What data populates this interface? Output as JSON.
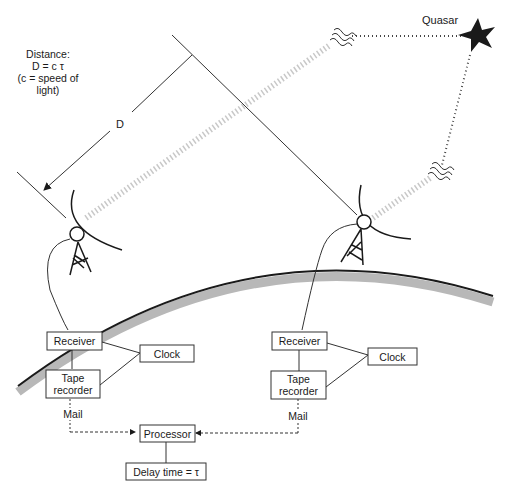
{
  "diagram": {
    "type": "Very Long Baseline Interferometry (VLBI) schematic",
    "source_label": "Quasar",
    "distance_note": {
      "line1": "Distance:",
      "line2": "D = c τ",
      "line3": "(c = speed of",
      "line4": "light)"
    },
    "distance_symbol": "D",
    "stations": [
      {
        "name": "left-station",
        "receiver": "Receiver",
        "clock": "Clock",
        "tape_recorder_line1": "Tape",
        "tape_recorder_line2": "recorder",
        "mail": "Mail"
      },
      {
        "name": "right-station",
        "receiver": "Receiver",
        "clock": "Clock",
        "tape_recorder_line1": "Tape",
        "tape_recorder_line2": "recorder",
        "mail": "Mail"
      }
    ],
    "processor": "Processor",
    "delay": "Delay time = τ",
    "colors": {
      "ink": "#1a1a1a",
      "earth_band": "#b8b8b8",
      "signal_beam": "#c8c8c8"
    }
  }
}
